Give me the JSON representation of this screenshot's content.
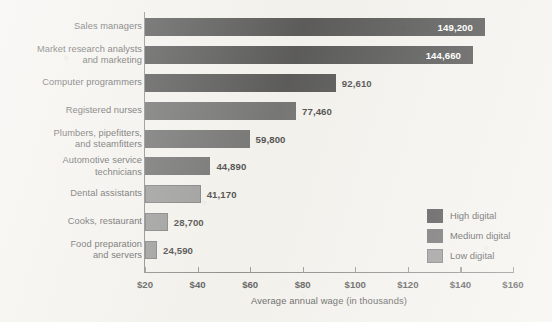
{
  "chart_data": {
    "type": "bar",
    "orientation": "horizontal",
    "title": "",
    "xlabel": "Average annual wage (in thousands)",
    "ylabel": "",
    "xlim": [
      20,
      160
    ],
    "xticks": [
      "$20",
      "$40",
      "$60",
      "$80",
      "$100",
      "$120",
      "$140",
      "$160"
    ],
    "xtick_values": [
      20,
      40,
      60,
      80,
      100,
      120,
      140,
      160
    ],
    "grid": false,
    "legend_position": "right-inside",
    "categories": [
      "Sales managers",
      "Market research analysts\nand marketing",
      "Computer programmers",
      "Registered nurses",
      "Plumbers, pipefitters,\nand steamfitters",
      "Automotive service\ntechnicians",
      "Dental assistants",
      "Cooks, restaurant",
      "Food preparation\nand servers"
    ],
    "values": [
      149200,
      144660,
      92610,
      77460,
      59800,
      44890,
      41170,
      28700,
      24590
    ],
    "value_labels": [
      "149,200",
      "144,660",
      "92,610",
      "77,460",
      "59,800",
      "44,890",
      "41,170",
      "28,700",
      "24,590"
    ],
    "label_placement": [
      "inside",
      "inside",
      "outside",
      "outside",
      "outside",
      "outside",
      "outside",
      "outside",
      "outside"
    ],
    "groups": [
      "high",
      "high",
      "high",
      "medium",
      "medium",
      "medium",
      "low",
      "low",
      "low"
    ],
    "legend": [
      {
        "key": "high",
        "label": "High digital",
        "color": "#3b3b3b"
      },
      {
        "key": "medium",
        "label": "Medium digital",
        "color": "#5c5c5c"
      },
      {
        "key": "low",
        "label": "Low digital",
        "color": "#8e8e8e"
      }
    ],
    "colors": {
      "high": "#3b3b3b",
      "medium": "#5c5c5c",
      "low": "#8e8e8e",
      "axis": "#7c7c7c",
      "background": "#f3f1ec",
      "text": "#3d3d3d"
    }
  }
}
